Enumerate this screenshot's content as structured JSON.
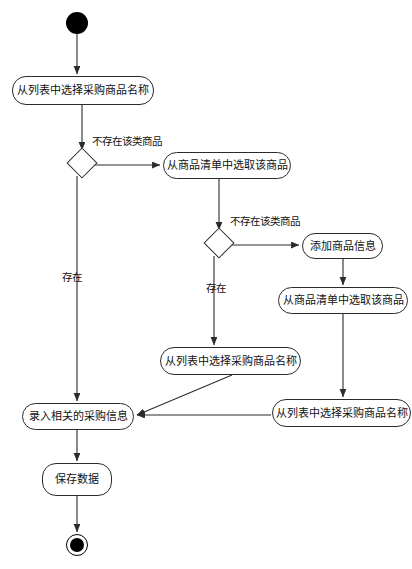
{
  "diagram": {
    "type": "uml-activity-diagram",
    "start_node": {
      "name": "start",
      "cx": 77,
      "cy": 23,
      "r": 11
    },
    "end_node": {
      "name": "end",
      "cx": 77,
      "cy": 545,
      "outer_r": 11,
      "inner_r": 7
    },
    "decisions": [
      {
        "id": "d1",
        "cx": 82,
        "cy": 163,
        "size": 22
      },
      {
        "id": "d2",
        "cx": 219,
        "cy": 243,
        "size": 22
      }
    ],
    "nodes": [
      {
        "id": "a1",
        "label": "从列表中选择采购商品名称",
        "x": 12,
        "y": 76,
        "w": 142,
        "h": 29
      },
      {
        "id": "a2",
        "label": "从商品清单中选取该商品",
        "x": 163,
        "y": 152,
        "w": 128,
        "h": 27
      },
      {
        "id": "a3",
        "label": "添加商品信息",
        "x": 302,
        "y": 233,
        "w": 81,
        "h": 26
      },
      {
        "id": "a4",
        "label": "从商品清单中选取该商品",
        "x": 278,
        "y": 287,
        "w": 130,
        "h": 27
      },
      {
        "id": "a5",
        "label": "从列表中选择采购商品名称",
        "x": 160,
        "y": 347,
        "w": 141,
        "h": 28
      },
      {
        "id": "a6",
        "label": "从列表中选择采购商品名称",
        "x": 272,
        "y": 399,
        "w": 139,
        "h": 28
      },
      {
        "id": "a7",
        "label": "录入相关的采购信息",
        "x": 22,
        "y": 403,
        "w": 112,
        "h": 27
      },
      {
        "id": "a8",
        "label": "保存数据",
        "x": 42,
        "y": 463,
        "w": 70,
        "h": 33
      }
    ],
    "edge_labels": [
      {
        "id": "l1",
        "text": "不存在该类商品",
        "x": 92,
        "y": 143
      },
      {
        "id": "l2",
        "text": "存在",
        "x": 62,
        "y": 272
      },
      {
        "id": "l3",
        "text": "不存在该类商品",
        "x": 230,
        "y": 223
      },
      {
        "id": "l4",
        "text": "存在",
        "x": 208,
        "y": 283
      }
    ],
    "colors": {
      "stroke": "#2b2b2b",
      "fill": "#ffffff",
      "text": "#111111",
      "node_fill": "#000000",
      "background": "#ffffff"
    }
  }
}
